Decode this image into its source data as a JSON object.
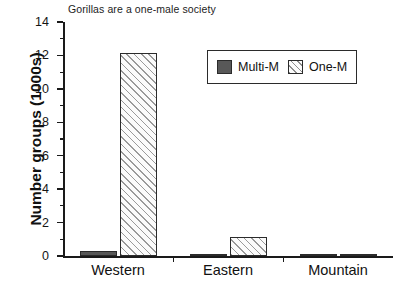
{
  "chart_data": {
    "type": "bar",
    "title": "Gorillas are a one-male society",
    "xlabel": "",
    "ylabel": "Number groups (1000s)",
    "categories": [
      "Western",
      "Eastern",
      "Mountain"
    ],
    "series": [
      {
        "name": "Multi-M",
        "values": [
          0.3,
          0.06,
          0.02
        ],
        "color": "#585858",
        "pattern": "solid"
      },
      {
        "name": "One-M",
        "values": [
          12.15,
          1.15,
          0.02
        ],
        "color": "#fbfbfb",
        "pattern": "diagonal-hatch"
      }
    ],
    "ylim": [
      0,
      14
    ],
    "ytick_labels": [
      "0",
      "2",
      "4",
      "6",
      "8",
      "10",
      "12",
      "14"
    ],
    "ytick_values": [
      0,
      2,
      4,
      6,
      8,
      10,
      12,
      14
    ],
    "ytick_minor_values": [
      1,
      3,
      5,
      7,
      9,
      11,
      13
    ],
    "grid": false,
    "legend_position": "upper-right-inside",
    "legend_entries": [
      "Multi-M",
      "One-M"
    ]
  },
  "axes": {
    "y_title": "Number groups (1000s)"
  }
}
